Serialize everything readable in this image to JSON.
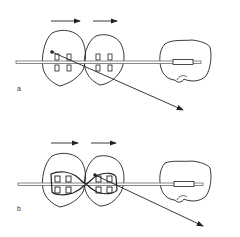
{
  "figure": {
    "panels": [
      {
        "label": "a",
        "description": "Two incisors with separate brackets on archwire, force arrows pointing right, ligature from first tooth pulling diagonally down-right, molar tube on distal tooth"
      },
      {
        "label": "b",
        "description": "Two incisors tied together with figure-eight ligature over brackets, force arrows pointing right, pull from second tooth diagonally down-right, molar tube on distal tooth"
      }
    ],
    "colors": {
      "line": "#222222",
      "wire": "#555555",
      "background": "#ffffff"
    }
  }
}
